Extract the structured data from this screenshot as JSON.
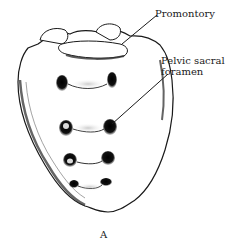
{
  "figure": {
    "caption": "A",
    "labels": [
      {
        "id": "promontory",
        "text": "Promontory"
      },
      {
        "id": "pelvic-sacral-foramen",
        "line1": "Pelvic sacral",
        "line2": "foramen"
      }
    ],
    "colors": {
      "ink": "#1a1a1a",
      "background": "#ffffff",
      "shade": "#555555"
    }
  }
}
